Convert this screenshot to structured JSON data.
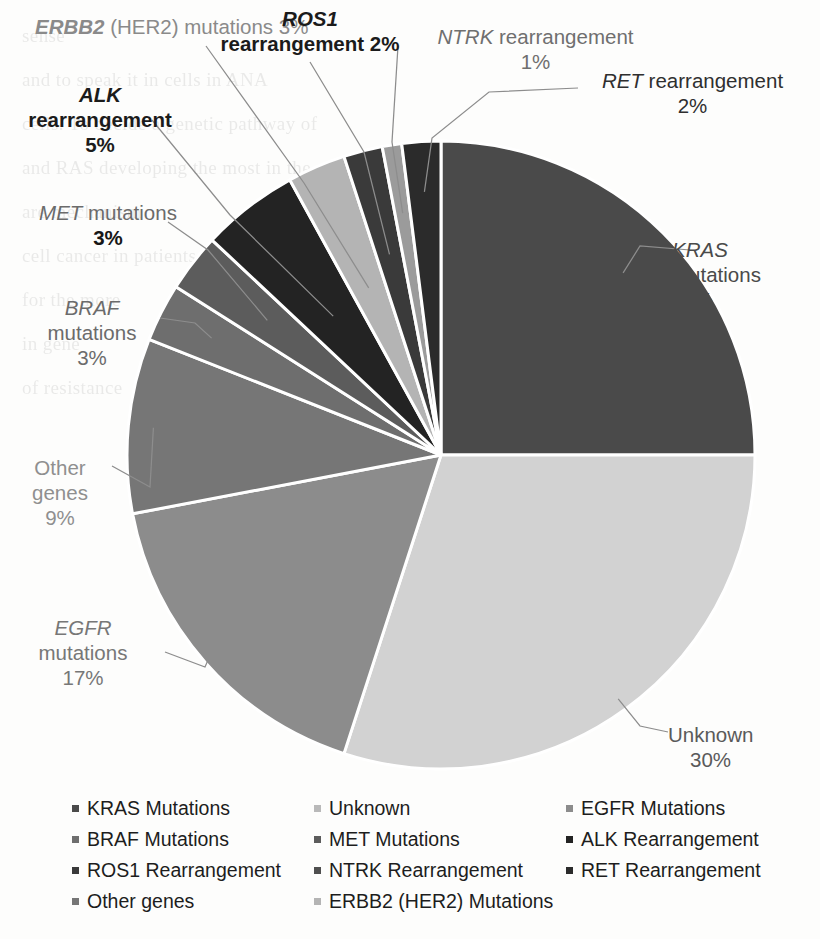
{
  "figure": {
    "kind": "pie-chart-figure",
    "background_note": "scanned book page with faint text bleed-through"
  },
  "chart_data": {
    "type": "pie",
    "title": "",
    "xlabel": "",
    "ylabel": "",
    "legend_position": "bottom",
    "grid": false,
    "start_angle_deg": 0,
    "direction": "clockwise",
    "categories": [
      "KRAS mutations",
      "Unknown",
      "EGFR mutations",
      "Other genes",
      "BRAF mutations",
      "MET mutations",
      "ALK rearrangement",
      "ERBB2 (HER2) mutations",
      "ROS1 rearrangement",
      "NTRK rearrangement",
      "RET rearrangement"
    ],
    "values": [
      25,
      30,
      17,
      9,
      3,
      3,
      5,
      3,
      2,
      1,
      2
    ],
    "units": "%",
    "colors": [
      "#4a4a4a",
      "#d2d2d2",
      "#8c8c8c",
      "#767676",
      "#6e6e6e",
      "#5c5c5c",
      "#232323",
      "#b4b4b4",
      "#3a3a3a",
      "#9b9b9b",
      "#2b2b2b"
    ],
    "slice_border_color": "#ffffff"
  },
  "callouts": [
    {
      "id": "kras",
      "gene": "KRAS",
      "rest": "mutations",
      "percent": "25%",
      "full": "KRAS mutations 25%"
    },
    {
      "id": "unknown",
      "gene": "",
      "rest": "Unknown",
      "percent": "30%",
      "full": "Unknown 30%"
    },
    {
      "id": "egfr",
      "gene": "EGFR",
      "rest": "mutations",
      "percent": "17%",
      "full": "EGFR mutations 17%"
    },
    {
      "id": "other-genes",
      "gene": "",
      "rest": "Other genes",
      "percent": "9%",
      "full": "Other genes 9%"
    },
    {
      "id": "braf",
      "gene": "BRAF",
      "rest": "mutations",
      "percent": "3%",
      "full": "BRAF mutations 3%"
    },
    {
      "id": "met",
      "gene": "MET",
      "rest": "mutations",
      "percent": "3%",
      "full": "MET mutations 3%"
    },
    {
      "id": "alk",
      "gene": "ALK",
      "rest": "rearrangement",
      "percent": "5%",
      "full": "ALK rearrangement 5%"
    },
    {
      "id": "erbb2",
      "gene": "ERBB2",
      "rest": "(HER2) mutations",
      "percent": "3%",
      "full": "ERBB2 (HER2) mutations 3%"
    },
    {
      "id": "ros1",
      "gene": "ROS1",
      "rest": "rearrangement",
      "percent": "2%",
      "full": "ROS1 rearrangement 2%"
    },
    {
      "id": "ntrk",
      "gene": "NTRK",
      "rest": "rearrangement",
      "percent": "1%",
      "full": "NTRK rearrangement 1%"
    },
    {
      "id": "ret",
      "gene": "RET",
      "rest": "rearrangement",
      "percent": "2%",
      "full": "RET rearrangement 2%"
    }
  ],
  "legend": {
    "columns": 3,
    "items": [
      {
        "label": "KRAS Mutations",
        "color": "#4a4a4a",
        "col": 1,
        "row": 1
      },
      {
        "label": "Unknown",
        "color": "#b9b9b9",
        "col": 2,
        "row": 1
      },
      {
        "label": "EGFR Mutations",
        "color": "#8c8c8c",
        "col": 3,
        "row": 1
      },
      {
        "label": "BRAF Mutations",
        "color": "#6e6e6e",
        "col": 1,
        "row": 2
      },
      {
        "label": "MET Mutations",
        "color": "#5c5c5c",
        "col": 2,
        "row": 2
      },
      {
        "label": "ALK Rearrangement",
        "color": "#232323",
        "col": 3,
        "row": 2
      },
      {
        "label": "ROS1 Rearrangement",
        "color": "#3a3a3a",
        "col": 1,
        "row": 3
      },
      {
        "label": "NTRK Rearrangement",
        "color": "#4f4f4f",
        "col": 2,
        "row": 3
      },
      {
        "label": "RET Rearrangement",
        "color": "#2b2b2b",
        "col": 3,
        "row": 3
      },
      {
        "label": "Other genes",
        "color": "#767676",
        "col": 1,
        "row": 4
      },
      {
        "label": "ERBB2 (HER2) Mutations",
        "color": "#b4b4b4",
        "col": 2,
        "row": 4
      }
    ]
  },
  "background_text_lines": [
    "sense",
    "and to speak it in cells  in ANA",
    "cells. To decide  a genetic pathway of",
    "and RAS developing the most in the",
    "are mechanism",
    "cell cancer in patients",
    "for the more",
    "in gene",
    "of resistance"
  ]
}
